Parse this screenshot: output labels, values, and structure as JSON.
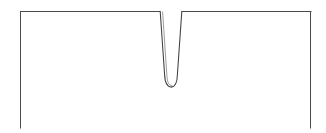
{
  "figure": {
    "background_color": "#ffffff",
    "line_color": "#4a4a4a",
    "notch_line_color": "#3f3f3f",
    "ghost_line_color": "#6e6e6e",
    "line_width": 1.05
  },
  "geometry": {
    "canvas": {
      "width": 326,
      "height": 133
    },
    "specimen": {
      "left_x": 20,
      "right_x": 311,
      "top_y": 11,
      "bottom_y": 128,
      "bottom_edge_drawn": false,
      "top_edge_drawn": true,
      "left_edge_drawn": true,
      "right_edge_drawn": true
    },
    "notch": {
      "opening_left_x": 160,
      "opening_right_x": 182,
      "opening_top_y": 11,
      "tip_bottom_y": 87,
      "tip_left_x": 166,
      "tip_right_x": 178,
      "tip_shape": "rounded",
      "opening_width": 22,
      "tip_width": 12,
      "depth": 76,
      "has_double_contour_left_flank": true
    }
  },
  "paths": {
    "top_edge_left": "M 20.5 11.5 L 160 11.5",
    "top_edge_right": "M 182 11.5 L 311 11.5",
    "left_edge": "M 20.5 11.5 L 20.5 128",
    "right_edge": "M 310.5 11.5 L 310.5 128",
    "notch_left_flank": "M 160.2 11.5 L 164.6 74.5 C 164.9 82.6 166.6 86.9 171.3 87.0",
    "notch_right_flank": "M 181.8 11.5 L 177.4 74.5 C 177.2 82.6 175.6 86.9 171.3 87.0",
    "notch_left_ghost": "M 162.6 12.0 L 166.8 74.2 C 167.1 81.8 168.6 85.6 172.0 85.8"
  }
}
